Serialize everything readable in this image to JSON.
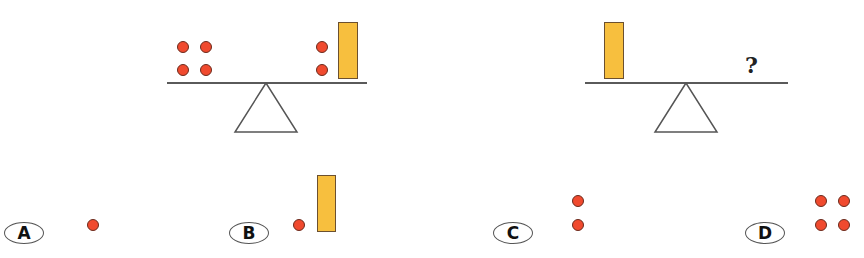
{
  "colors": {
    "ball_fill": "#f04a2e",
    "ball_stroke": "#6b2a1c",
    "block_fill": "#f7bf3e",
    "block_stroke": "#6b5030",
    "beam": "#5a5a5a"
  },
  "scale_left": {
    "left_pan": "4 balls (2x2)",
    "right_pan": "2 balls + 1 block",
    "balanced": true
  },
  "scale_right": {
    "left_pan": "1 block",
    "right_pan_unknown": "?"
  },
  "options": [
    {
      "label": "A",
      "content": "1 ball"
    },
    {
      "label": "B",
      "content": "1 ball + 1 block"
    },
    {
      "label": "C",
      "content": "2 balls"
    },
    {
      "label": "D",
      "content": "4 balls"
    }
  ]
}
